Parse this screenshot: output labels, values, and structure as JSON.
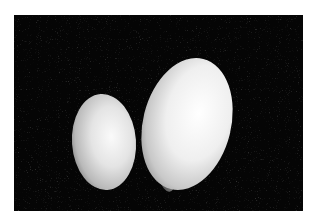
{
  "image": {
    "description": "Grayscale photograph of two eggs, a smaller one on the left and a larger one on the right, resting on dark grassy ground",
    "subjects": [
      {
        "name": "small-egg",
        "shade": "#e6e6e6"
      },
      {
        "name": "large-egg",
        "shade": "#f2f2f2"
      }
    ],
    "background_color": "#050505",
    "frame_color": "#ffffff"
  }
}
